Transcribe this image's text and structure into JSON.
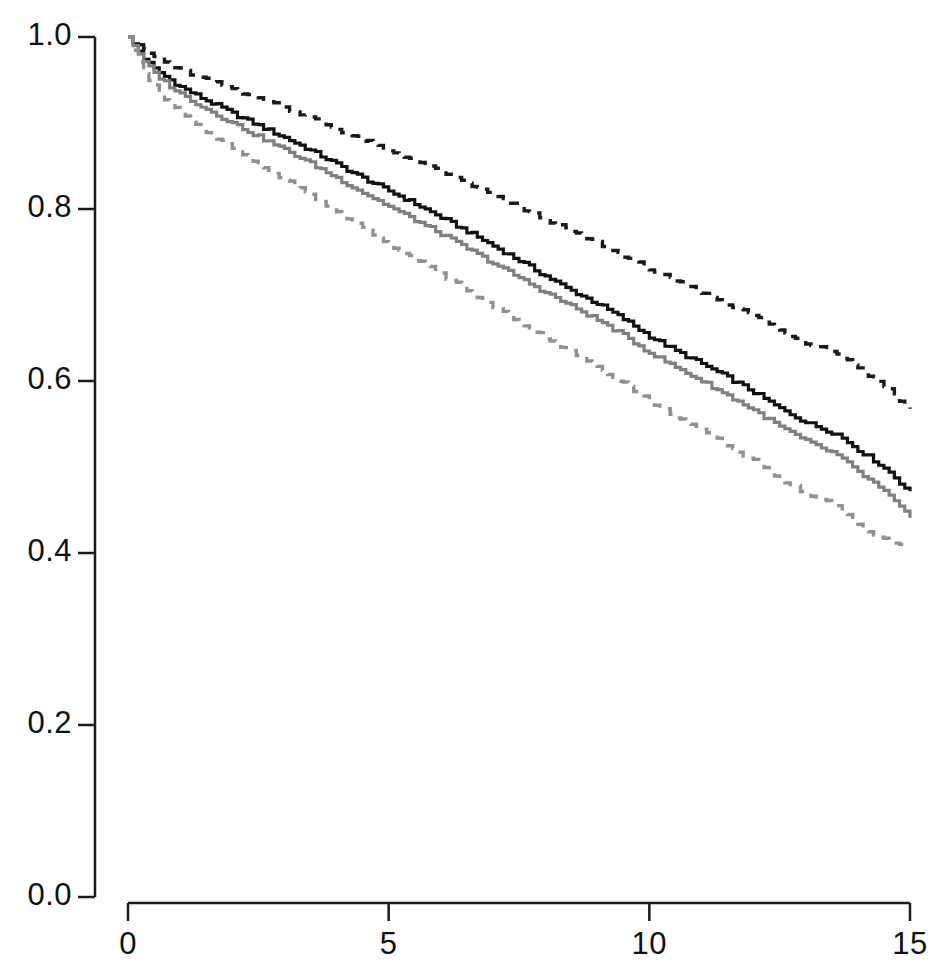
{
  "figure": {
    "background_color": "#ffffff",
    "title": "",
    "subtitle": ""
  },
  "axes": {
    "x": {
      "label": "",
      "tick_labels": [
        "0",
        "5",
        "10",
        "15"
      ],
      "tick_values": [
        0,
        5,
        10,
        15
      ],
      "range": [
        0,
        15
      ],
      "axis_color": "#1a1a1a"
    },
    "y": {
      "label": "",
      "tick_labels": [
        "0.0",
        "0.2",
        "0.4",
        "0.6",
        "0.8",
        "1.0"
      ],
      "tick_values": [
        0.0,
        0.2,
        0.4,
        0.6,
        0.8,
        1.0
      ],
      "range": [
        0,
        1
      ],
      "axis_color": "#1a1a1a"
    }
  },
  "colors": {
    "observed": "#111111",
    "observed_ci": "#1a1a1a",
    "expected": "#808080",
    "expected_ci": "#909090"
  },
  "chart_data": {
    "type": "line",
    "title": "",
    "xlabel": "",
    "ylabel": "",
    "xlim": [
      0,
      15
    ],
    "ylim": [
      0,
      1
    ],
    "grid": false,
    "legend": "none",
    "note": "Kaplan-Meier style survival step curves: two estimates (black solid, gray solid) each with dashed confidence bands.",
    "x": [
      0,
      0.15,
      0.3,
      0.5,
      0.75,
      1,
      1.25,
      1.5,
      1.75,
      2,
      2.5,
      3,
      3.5,
      4,
      4.5,
      5,
      5.5,
      6,
      6.5,
      7,
      7.5,
      8,
      8.5,
      9,
      9.5,
      10,
      10.5,
      11,
      11.5,
      12,
      12.5,
      13,
      13.3,
      13.6,
      14,
      14.3,
      14.6,
      14.8,
      15
    ],
    "series": [
      {
        "name": "observed-survival",
        "style": "solid",
        "color": "#111111",
        "values": [
          1.0,
          0.988,
          0.975,
          0.963,
          0.952,
          0.942,
          0.934,
          0.926,
          0.919,
          0.911,
          0.897,
          0.883,
          0.868,
          0.852,
          0.836,
          0.821,
          0.806,
          0.79,
          0.774,
          0.757,
          0.74,
          0.722,
          0.705,
          0.69,
          0.672,
          0.652,
          0.635,
          0.62,
          0.604,
          0.587,
          0.568,
          0.552,
          0.545,
          0.538,
          0.52,
          0.508,
          0.494,
          0.482,
          0.47
        ]
      },
      {
        "name": "observed-upper-ci",
        "style": "dashed",
        "color": "#1a1a1a",
        "values": [
          1.0,
          0.994,
          0.985,
          0.977,
          0.969,
          0.962,
          0.956,
          0.95,
          0.945,
          0.94,
          0.929,
          0.918,
          0.906,
          0.893,
          0.88,
          0.868,
          0.856,
          0.843,
          0.83,
          0.816,
          0.802,
          0.788,
          0.774,
          0.761,
          0.746,
          0.73,
          0.716,
          0.703,
          0.69,
          0.676,
          0.659,
          0.645,
          0.639,
          0.632,
          0.615,
          0.604,
          0.59,
          0.578,
          0.567
        ]
      },
      {
        "name": "expected-survival",
        "style": "solid",
        "color": "#808080",
        "values": [
          1.0,
          0.985,
          0.971,
          0.958,
          0.945,
          0.934,
          0.925,
          0.916,
          0.908,
          0.9,
          0.884,
          0.869,
          0.853,
          0.836,
          0.819,
          0.803,
          0.787,
          0.771,
          0.754,
          0.737,
          0.72,
          0.703,
          0.687,
          0.671,
          0.653,
          0.633,
          0.616,
          0.6,
          0.583,
          0.566,
          0.547,
          0.53,
          0.522,
          0.514,
          0.494,
          0.481,
          0.466,
          0.453,
          0.44
        ]
      },
      {
        "name": "expected-lower-ci",
        "style": "dashed",
        "color": "#909090",
        "values": [
          1.0,
          0.977,
          0.959,
          0.942,
          0.926,
          0.912,
          0.901,
          0.89,
          0.88,
          0.871,
          0.852,
          0.834,
          0.816,
          0.797,
          0.778,
          0.76,
          0.742,
          0.724,
          0.706,
          0.687,
          0.669,
          0.651,
          0.634,
          0.617,
          0.598,
          0.577,
          0.559,
          0.542,
          0.525,
          0.507,
          0.487,
          0.47,
          0.462,
          0.454,
          0.434,
          0.421,
          0.413,
          0.411,
          0.408
        ]
      }
    ]
  }
}
